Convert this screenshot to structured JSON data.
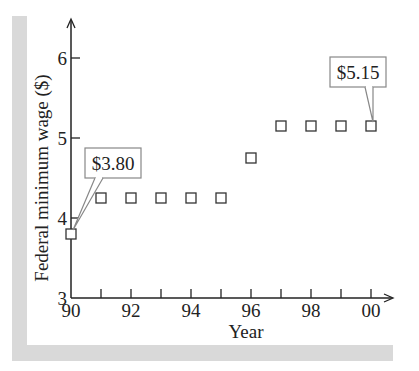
{
  "chart_data": {
    "type": "scatter",
    "title": "",
    "xlabel": "Year",
    "ylabel": "Federal minimum wage ($)",
    "x": [
      "90",
      "91",
      "92",
      "93",
      "94",
      "95",
      "96",
      "97",
      "98",
      "99",
      "00"
    ],
    "values": [
      3.8,
      4.25,
      4.25,
      4.25,
      4.25,
      4.25,
      4.75,
      5.15,
      5.15,
      5.15,
      5.15
    ],
    "x_tick_labels": [
      "90",
      "92",
      "94",
      "96",
      "98",
      "00"
    ],
    "y_tick_labels": [
      "3",
      "4",
      "5",
      "6"
    ],
    "ylim": [
      3,
      6.5
    ],
    "grid": false,
    "legend": null,
    "marker": "open-square",
    "annotations": [
      {
        "label": "$3.80",
        "x": "90",
        "y": 3.8
      },
      {
        "label": "$5.15",
        "x": "00",
        "y": 5.15
      }
    ]
  },
  "colors": {
    "frame": "#d9d9d9",
    "axis": "#222222",
    "marker": "#333333",
    "callout_border": "#888888"
  }
}
